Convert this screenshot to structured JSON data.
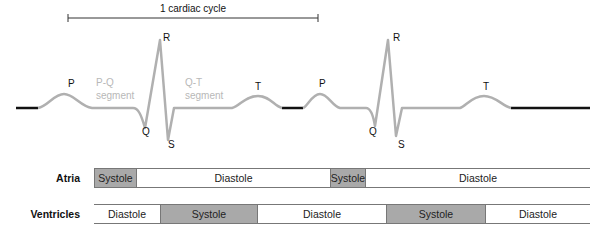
{
  "cycle_label": "1 cardiac cycle",
  "waves": {
    "p": "P",
    "q": "Q",
    "r": "R",
    "s": "S",
    "t": "T"
  },
  "segments": {
    "pq_line1": "P-Q",
    "pq_line2": "segment",
    "qt_line1": "Q-T",
    "qt_line2": "segment"
  },
  "rows": {
    "atria": {
      "label": "Atria",
      "cells": [
        {
          "label": "Systole",
          "phase": "systole",
          "x": 94,
          "w": 43
        },
        {
          "label": "Diastole",
          "phase": "diastole",
          "x": 137,
          "w": 193
        },
        {
          "label": "Systole",
          "phase": "systole",
          "x": 330,
          "w": 36
        },
        {
          "label": "Diastole",
          "phase": "diastole",
          "x": 366,
          "w": 224
        }
      ]
    },
    "ventricles": {
      "label": "Ventricles",
      "cells": [
        {
          "label": "Diastole",
          "phase": "diastole",
          "x": 94,
          "w": 66
        },
        {
          "label": "Systole",
          "phase": "systole",
          "x": 160,
          "w": 98
        },
        {
          "label": "Diastole",
          "phase": "diastole",
          "x": 258,
          "w": 128
        },
        {
          "label": "Systole",
          "phase": "systole",
          "x": 386,
          "w": 100
        },
        {
          "label": "Diastole",
          "phase": "diastole",
          "x": 486,
          "w": 104
        }
      ]
    }
  },
  "colors": {
    "trace": "#b0b0b0",
    "baseline": "#111111",
    "systole_fill": "#a9a9a9"
  }
}
